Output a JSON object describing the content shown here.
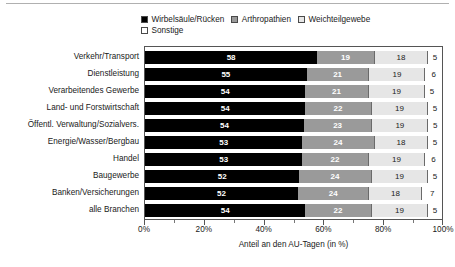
{
  "chart_data": {
    "type": "bar",
    "orientation": "horizontal",
    "stacked": true,
    "stacked_mode": "percent",
    "title": "",
    "subtitle": "",
    "xlabel": "Anteil an den AU-Tagen (in %)",
    "ylabel": "",
    "xlim": [
      0,
      100
    ],
    "xticks": [
      0,
      20,
      40,
      60,
      80,
      100
    ],
    "xtick_labels": [
      "0%",
      "20%",
      "40%",
      "60%",
      "80%",
      "100%"
    ],
    "minor_xticks": [
      10,
      30,
      50,
      70,
      90
    ],
    "grid": false,
    "legend_position": "top",
    "categories": [
      "Verkehr/Transport",
      "Dienstleistung",
      "Verarbeitendes Gewerbe",
      "Land- und Forstwirtschaft",
      "Öffentl. Verwaltung/Sozialvers.",
      "Energie/Wasser/Bergbau",
      "Handel",
      "Baugewerbe",
      "Banken/Versicherungen",
      "alle Branchen"
    ],
    "series": [
      {
        "name": "Wirbelsäule/Rücken",
        "color": "#000000",
        "values": [
          58,
          55,
          54,
          54,
          54,
          53,
          53,
          52,
          52,
          54
        ]
      },
      {
        "name": "Arthropathien",
        "color": "#9a9a9a",
        "values": [
          19,
          21,
          21,
          22,
          23,
          24,
          22,
          24,
          24,
          22
        ]
      },
      {
        "name": "Weichteilgewebe",
        "color": "#e6e6e6",
        "values": [
          18,
          19,
          19,
          19,
          19,
          18,
          19,
          19,
          18,
          19
        ]
      },
      {
        "name": "Sonstige",
        "color": "#ffffff",
        "values": [
          5,
          6,
          5,
          5,
          5,
          5,
          6,
          5,
          7,
          5
        ]
      }
    ]
  }
}
